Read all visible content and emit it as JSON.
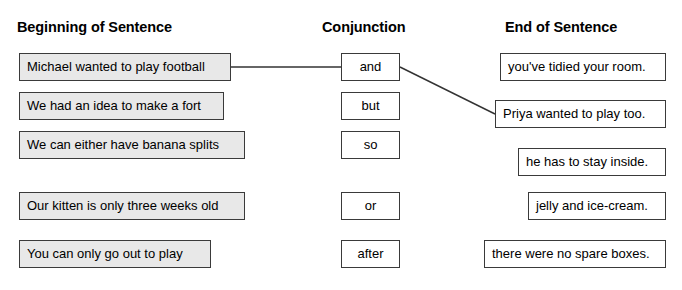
{
  "headings": {
    "beginning": "Beginning of Sentence",
    "conjunction": "Conjunction",
    "ending": "End of Sentence"
  },
  "colors": {
    "beginning_fill": "#e8e8e8",
    "conjunction_fill": "#ffffff",
    "ending_fill": "#ffffff",
    "border": "#3a3a3a",
    "line": "#333333",
    "text": "#000000",
    "background": "#ffffff"
  },
  "beginnings": [
    {
      "text": "Michael wanted to play football",
      "left": 19,
      "top": 53,
      "width": 212
    },
    {
      "text": "We had an idea to make a fort",
      "left": 19,
      "top": 92,
      "width": 205
    },
    {
      "text": "We can either have banana splits",
      "left": 19,
      "top": 131,
      "width": 226
    },
    {
      "text": "Our kitten is only three weeks old",
      "left": 19,
      "top": 192,
      "width": 226
    },
    {
      "text": "You can only go out to play",
      "left": 19,
      "top": 240,
      "width": 192
    }
  ],
  "conjunctions": [
    {
      "text": "and",
      "top": 53
    },
    {
      "text": "but",
      "top": 92
    },
    {
      "text": "so",
      "top": 131
    },
    {
      "text": "or",
      "top": 192
    },
    {
      "text": "after",
      "top": 240
    }
  ],
  "endings": [
    {
      "text": "you've tidied your room.",
      "left": 500,
      "top": 53,
      "width": 166
    },
    {
      "text": "Priya wanted to play too.",
      "left": 495,
      "top": 100,
      "width": 171
    },
    {
      "text": "he has to stay inside.",
      "left": 518,
      "top": 148,
      "width": 148
    },
    {
      "text": "jelly and ice-cream.",
      "left": 528,
      "top": 192,
      "width": 138
    },
    {
      "text": "there were no spare boxes.",
      "left": 484,
      "top": 240,
      "width": 182
    }
  ],
  "connections": [
    {
      "from": "Michael wanted to play football",
      "to": "and",
      "x1": 231,
      "y1": 67,
      "x2": 341,
      "y2": 67
    },
    {
      "from": "and",
      "to": "Priya wanted to play too.",
      "x1": 400,
      "y1": 67,
      "x2": 495,
      "y2": 114
    }
  ]
}
